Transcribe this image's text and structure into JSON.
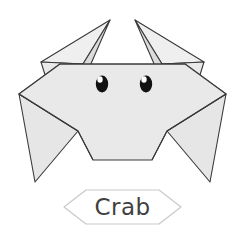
{
  "page": {
    "background_color": "#ffffff",
    "width": 245,
    "height": 225
  },
  "illustration": {
    "name": "origami-crab",
    "title": "Crab",
    "style": "folded paper origami diagram",
    "fill_color": "#e9e9e9",
    "fill_color_light": "#f1f1f1",
    "fill_color_shade": "#dedede",
    "stroke_color": "#3a3a3a",
    "stroke_width": 1.1,
    "parts": [
      {
        "name": "left-claw",
        "label": "Left claw"
      },
      {
        "name": "right-claw",
        "label": "Right claw"
      },
      {
        "name": "shell-body",
        "label": "Shell body"
      },
      {
        "name": "left-leg",
        "label": "Left leg"
      },
      {
        "name": "right-leg",
        "label": "Right leg"
      },
      {
        "name": "left-eye",
        "label": "Left eye"
      },
      {
        "name": "right-eye",
        "label": "Right eye"
      }
    ]
  },
  "eyes": {
    "pupil_color": "#111111",
    "highlight_color": "#ffffff",
    "left": {
      "cx": 102,
      "cy": 84,
      "rx": 6.2,
      "ry": 8.4
    },
    "right": {
      "cx": 146,
      "cy": 84,
      "rx": 6.2,
      "ry": 8.4
    }
  },
  "caption": {
    "text": "Crab",
    "text_color": "#3f3f3f",
    "banner_stroke_color": "#c9c9c9",
    "banner_shape": "hexagon"
  }
}
